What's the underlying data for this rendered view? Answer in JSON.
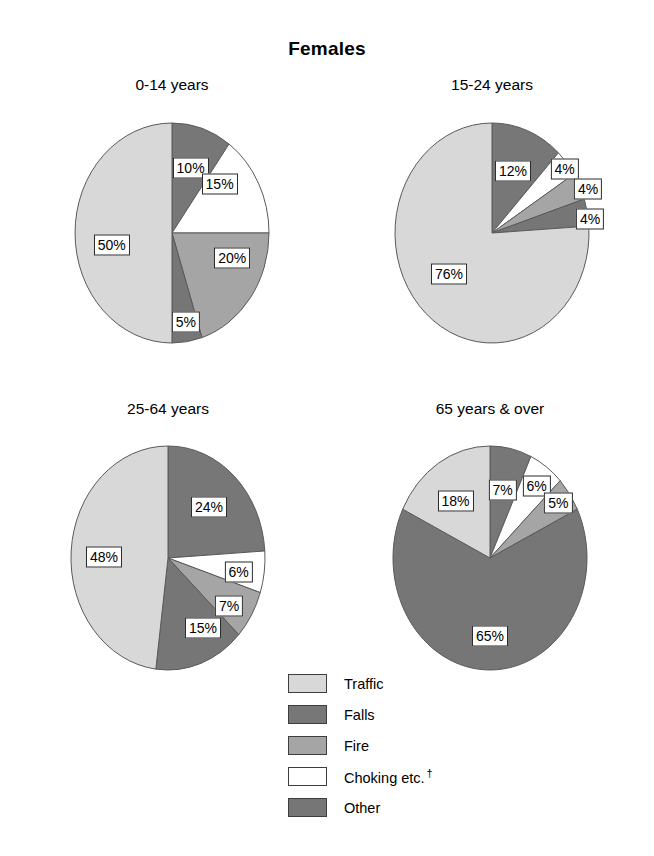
{
  "figure": {
    "title": "Females",
    "legend_title": "",
    "footnote_marker": "†"
  },
  "legend": {
    "items": [
      {
        "label": "Traffic",
        "color": "#d8d8d8"
      },
      {
        "label": "Falls",
        "color": "#777777"
      },
      {
        "label": "Fire",
        "color": "#a5a5a5"
      },
      {
        "label": "Choking etc.",
        "color": "#ffffff",
        "marker": "†"
      },
      {
        "label": "Other",
        "color": "#767676"
      }
    ]
  },
  "chart_data": [
    {
      "type": "pie",
      "title": "0-14 years",
      "categories": [
        "Falls",
        "Choking etc.",
        "Fire",
        "Other",
        "Traffic"
      ],
      "values": [
        10,
        15,
        20,
        5,
        50
      ],
      "labels": [
        "10%",
        "15%",
        "20%",
        "5%",
        "50%"
      ],
      "colors": [
        "#777777",
        "#ffffff",
        "#a5a5a5",
        "#767676",
        "#d8d8d8"
      ],
      "start_angle_deg": 0,
      "direction": "clockwise",
      "units": "percent"
    },
    {
      "type": "pie",
      "title": "15-24 years",
      "categories": [
        "Falls",
        "Choking etc.",
        "Fire",
        "Other",
        "Traffic"
      ],
      "values": [
        12,
        4,
        4,
        4,
        76
      ],
      "labels": [
        "12%",
        "4%",
        "4%",
        "4%",
        "76%"
      ],
      "colors": [
        "#777777",
        "#ffffff",
        "#a5a5a5",
        "#767676",
        "#d8d8d8"
      ],
      "start_angle_deg": 0,
      "direction": "clockwise",
      "units": "percent"
    },
    {
      "type": "pie",
      "title": "25-64 years",
      "categories": [
        "Falls",
        "Choking etc.",
        "Fire",
        "Other",
        "Traffic"
      ],
      "values": [
        24,
        6,
        7,
        15,
        48
      ],
      "labels": [
        "24%",
        "6%",
        "7%",
        "15%",
        "48%"
      ],
      "colors": [
        "#777777",
        "#ffffff",
        "#a5a5a5",
        "#767676",
        "#d8d8d8"
      ],
      "start_angle_deg": 0,
      "direction": "clockwise",
      "units": "percent"
    },
    {
      "type": "pie",
      "title": "65 years & over",
      "categories": [
        "Falls",
        "Choking etc.",
        "Fire",
        "Other",
        "Traffic"
      ],
      "values": [
        7,
        6,
        5,
        65,
        18
      ],
      "labels": [
        "7%",
        "6%",
        "5%",
        "65%",
        "18%"
      ],
      "colors": [
        "#777777",
        "#ffffff",
        "#a5a5a5",
        "#767676",
        "#d8d8d8"
      ],
      "start_angle_deg": 0,
      "direction": "clockwise",
      "units": "percent"
    }
  ],
  "layout": {
    "panels": [
      {
        "title_left": 42,
        "title_top": 76,
        "cx": 172,
        "cy": 233,
        "rx": 97,
        "ry": 110
      },
      {
        "title_left": 362,
        "title_top": 76,
        "cx": 492,
        "cy": 233,
        "rx": 97,
        "ry": 110
      },
      {
        "title_left": 38,
        "title_top": 400,
        "cx": 168,
        "cy": 558,
        "rx": 97,
        "ry": 112
      },
      {
        "title_left": 360,
        "title_top": 400,
        "cx": 490,
        "cy": 558,
        "rx": 97,
        "ry": 112
      }
    ],
    "label_offsets": [
      [
        {
          "r": 0.62,
          "a": 18
        },
        {
          "r": 0.66,
          "a": 48
        },
        {
          "r": 0.66,
          "a": 110
        },
        {
          "r": 0.82,
          "a": 170
        },
        {
          "r": 0.63,
          "a": 260
        }
      ],
      [
        {
          "r": 0.6,
          "a": 21
        },
        {
          "r": 0.95,
          "a": 52
        },
        {
          "r": 1.07,
          "a": 68
        },
        {
          "r": 1.02,
          "a": 83
        },
        {
          "r": 0.58,
          "a": 230
        }
      ],
      [
        {
          "r": 0.62,
          "a": 43
        },
        {
          "r": 0.74,
          "a": 100
        },
        {
          "r": 0.76,
          "a": 124
        },
        {
          "r": 0.72,
          "a": 150
        },
        {
          "r": 0.66,
          "a": 271
        }
      ],
      [
        {
          "r": 0.62,
          "a": 12
        },
        {
          "r": 0.8,
          "a": 37
        },
        {
          "r": 0.86,
          "a": 55
        },
        {
          "r": 0.7,
          "a": 180
        },
        {
          "r": 0.62,
          "a": 325
        }
      ]
    ]
  }
}
